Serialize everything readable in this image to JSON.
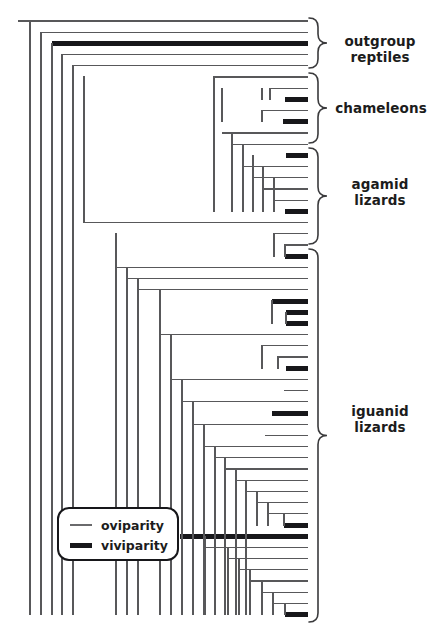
{
  "figure": {
    "type": "phylogenetic-cladogram",
    "width": 433,
    "height": 629,
    "background": "#ffffff",
    "line_color": "#58585a",
    "viviparity_color": "#17171a",
    "text_color": "#1c1c1c"
  },
  "legend": {
    "title": "",
    "box": {
      "x": 58,
      "y": 508,
      "width": 120,
      "height": 52,
      "radius": 11,
      "stroke": "#17171a",
      "stroke_width": 2
    },
    "items": [
      {
        "label": "oviparity",
        "style": "thin-line",
        "line_width": 1.3,
        "color": "#6a6a6c"
      },
      {
        "label": "viviparity",
        "style": "thick-line",
        "line_width": 5.0,
        "color": "#17171a"
      }
    ]
  },
  "clade_labels": [
    {
      "name": "outgroup-reptiles",
      "text": "outgroup\nreptiles",
      "x": 344,
      "y": 33,
      "bracket": {
        "top": 18,
        "bottom": 68
      }
    },
    {
      "name": "chameleons",
      "text": "chameleons",
      "x": 338,
      "y": 100,
      "bracket": {
        "top": 73,
        "bottom": 143
      }
    },
    {
      "name": "agamid-lizards",
      "text": "agamid\nlizards",
      "x": 350,
      "y": 176,
      "bracket": {
        "top": 148,
        "bottom": 244
      }
    },
    {
      "name": "iguanid-lizards",
      "text": "iguanid\nlizards",
      "x": 350,
      "y": 403,
      "bracket": {
        "top": 249,
        "bottom": 622
      }
    }
  ],
  "bracket": {
    "x": 318,
    "depth": 9,
    "stroke": "#3a3a3c",
    "stroke_width": 1.6
  },
  "chart_data": {
    "type": "cladogram",
    "title": "",
    "xlabel": "",
    "ylabel": "",
    "tip_count": 54,
    "tip_x": 308,
    "first_tip_y": 21,
    "tip_spacing": 11.2,
    "states": [
      "oviparity",
      "viviparity"
    ],
    "tips": [
      {
        "i": 0,
        "state": "oviparity",
        "node_x": 30
      },
      {
        "i": 1,
        "state": "oviparity",
        "node_x": 41
      },
      {
        "i": 2,
        "state": "viviparity",
        "node_x": 52,
        "vivi_from": 292
      },
      {
        "i": 3,
        "state": "oviparity",
        "node_x": 62
      },
      {
        "i": 4,
        "state": "oviparity",
        "node_x": 73
      },
      {
        "i": 5,
        "state": "oviparity",
        "node_x": 214
      },
      {
        "i": 6,
        "state": "oviparity",
        "node_x": 270
      },
      {
        "i": 7,
        "state": "viviparity",
        "node_x": 285,
        "vivi_from": 292
      },
      {
        "i": 8,
        "state": "oviparity",
        "node_x": 262
      },
      {
        "i": 9,
        "state": "viviparity",
        "node_x": 283,
        "vivi_from": 292
      },
      {
        "i": 10,
        "state": "oviparity",
        "node_x": 222
      },
      {
        "i": 11,
        "state": "oviparity",
        "node_x": 232
      },
      {
        "i": 12,
        "state": "viviparity",
        "node_x": 286,
        "vivi_from": 290
      },
      {
        "i": 13,
        "state": "oviparity",
        "node_x": 243
      },
      {
        "i": 14,
        "state": "oviparity",
        "node_x": 253
      },
      {
        "i": 15,
        "state": "oviparity",
        "node_x": 263
      },
      {
        "i": 16,
        "state": "oviparity",
        "node_x": 274
      },
      {
        "i": 17,
        "state": "viviparity",
        "node_x": 285,
        "vivi_from": 290
      },
      {
        "i": 18,
        "state": "oviparity",
        "node_x": 84
      },
      {
        "i": 19,
        "state": "oviparity",
        "node_x": 274
      },
      {
        "i": 20,
        "state": "oviparity",
        "node_x": 285
      },
      {
        "i": 21,
        "state": "viviparity",
        "node_x": 285,
        "vivi_from": 290
      },
      {
        "i": 22,
        "state": "oviparity",
        "node_x": 116
      },
      {
        "i": 23,
        "state": "oviparity",
        "node_x": 127
      },
      {
        "i": 24,
        "state": "oviparity",
        "node_x": 138
      },
      {
        "i": 25,
        "state": "viviparity",
        "node_x": 272,
        "vivi_from": 280
      },
      {
        "i": 26,
        "state": "viviparity",
        "node_x": 286,
        "vivi_from": 290
      },
      {
        "i": 27,
        "state": "viviparity",
        "node_x": 286,
        "vivi_from": 290
      },
      {
        "i": 28,
        "state": "oviparity",
        "node_x": 160
      },
      {
        "i": 29,
        "state": "oviparity",
        "node_x": 262
      },
      {
        "i": 30,
        "state": "oviparity",
        "node_x": 278
      },
      {
        "i": 31,
        "state": "viviparity",
        "node_x": 286,
        "vivi_from": 290
      },
      {
        "i": 32,
        "state": "oviparity",
        "node_x": 171
      },
      {
        "i": 33,
        "state": "oviparity",
        "node_x": 284
      },
      {
        "i": 34,
        "state": "oviparity",
        "node_x": 182
      },
      {
        "i": 35,
        "state": "viviparity",
        "node_x": 272,
        "vivi_from": 278
      },
      {
        "i": 36,
        "state": "oviparity",
        "node_x": 193
      },
      {
        "i": 37,
        "state": "oviparity",
        "node_x": 265
      },
      {
        "i": 38,
        "state": "oviparity",
        "node_x": 204
      },
      {
        "i": 39,
        "state": "oviparity",
        "node_x": 215
      },
      {
        "i": 40,
        "state": "oviparity",
        "node_x": 225
      },
      {
        "i": 41,
        "state": "oviparity",
        "node_x": 236
      },
      {
        "i": 42,
        "state": "oviparity",
        "node_x": 246
      },
      {
        "i": 43,
        "state": "oviparity",
        "node_x": 257
      },
      {
        "i": 44,
        "state": "oviparity",
        "node_x": 268
      },
      {
        "i": 45,
        "state": "viviparity",
        "node_x": 284,
        "vivi_from": 289
      },
      {
        "i": 46,
        "state": "viviparity",
        "node_x": 180,
        "vivi_from": 180
      },
      {
        "i": 47,
        "state": "oviparity",
        "node_x": 205
      },
      {
        "i": 48,
        "state": "oviparity",
        "node_x": 228
      },
      {
        "i": 49,
        "state": "oviparity",
        "node_x": 239
      },
      {
        "i": 50,
        "state": "oviparity",
        "node_x": 250
      },
      {
        "i": 51,
        "state": "oviparity",
        "node_x": 262
      },
      {
        "i": 52,
        "state": "oviparity",
        "node_x": 273
      },
      {
        "i": 53,
        "state": "viviparity",
        "node_x": 285,
        "vivi_from": 289
      }
    ],
    "internal_nodes": [
      {
        "id": "root",
        "x": 30,
        "top_i": 0,
        "bot_i": 53,
        "parent_x": 18
      },
      {
        "id": "n1",
        "x": 41,
        "top_i": 1,
        "bot_i": 53
      },
      {
        "id": "n2",
        "x": 52,
        "top_i": 2,
        "bot_i": 53
      },
      {
        "id": "n3",
        "x": 62,
        "top_i": 3,
        "bot_i": 53
      },
      {
        "id": "n4",
        "x": 73,
        "top_i": 4,
        "bot_i": 53
      },
      {
        "id": "n5",
        "x": 84,
        "top_i": 5,
        "bot_i": 18
      },
      {
        "id": "n6",
        "x": 214,
        "top_i": 5,
        "bot_i": 17
      },
      {
        "id": "n7",
        "x": 222,
        "top_i": 6,
        "bot_i": 9
      },
      {
        "id": "n8",
        "x": 262,
        "top_i": 6,
        "bot_i": 7
      },
      {
        "id": "n9",
        "x": 270,
        "top_i": 6,
        "bot_i": 7
      },
      {
        "id": "n10",
        "x": 262,
        "top_i": 8,
        "bot_i": 9
      },
      {
        "id": "n11",
        "x": 232,
        "top_i": 10,
        "bot_i": 17
      },
      {
        "id": "n12",
        "x": 243,
        "top_i": 11,
        "bot_i": 17
      },
      {
        "id": "n13",
        "x": 253,
        "top_i": 12,
        "bot_i": 17
      },
      {
        "id": "n14",
        "x": 263,
        "top_i": 13,
        "bot_i": 17
      },
      {
        "id": "n15",
        "x": 274,
        "top_i": 14,
        "bot_i": 17
      },
      {
        "id": "n16",
        "x": 116,
        "top_i": 19,
        "bot_i": 53
      },
      {
        "id": "n17",
        "x": 274,
        "top_i": 19,
        "bot_i": 21
      },
      {
        "id": "n18",
        "x": 285,
        "top_i": 20,
        "bot_i": 21
      },
      {
        "id": "n19",
        "x": 127,
        "top_i": 22,
        "bot_i": 53
      },
      {
        "id": "n20",
        "x": 138,
        "top_i": 23,
        "bot_i": 53
      },
      {
        "id": "n21",
        "x": 160,
        "top_i": 24,
        "bot_i": 53
      },
      {
        "id": "n22",
        "x": 272,
        "top_i": 25,
        "bot_i": 27
      },
      {
        "id": "n23",
        "x": 286,
        "top_i": 26,
        "bot_i": 27
      },
      {
        "id": "n24",
        "x": 171,
        "top_i": 28,
        "bot_i": 53
      },
      {
        "id": "n25",
        "x": 262,
        "top_i": 29,
        "bot_i": 31
      },
      {
        "id": "n26",
        "x": 278,
        "top_i": 30,
        "bot_i": 31
      },
      {
        "id": "n27",
        "x": 182,
        "top_i": 32,
        "bot_i": 53
      },
      {
        "id": "n28",
        "x": 193,
        "top_i": 34,
        "bot_i": 53
      },
      {
        "id": "n29",
        "x": 204,
        "top_i": 36,
        "bot_i": 53
      },
      {
        "id": "n30",
        "x": 215,
        "top_i": 38,
        "bot_i": 53
      },
      {
        "id": "n31",
        "x": 225,
        "top_i": 39,
        "bot_i": 53
      },
      {
        "id": "n32",
        "x": 236,
        "top_i": 40,
        "bot_i": 53
      },
      {
        "id": "n33",
        "x": 246,
        "top_i": 41,
        "bot_i": 53
      },
      {
        "id": "n34",
        "x": 257,
        "top_i": 42,
        "bot_i": 45
      },
      {
        "id": "n35",
        "x": 268,
        "top_i": 43,
        "bot_i": 45
      },
      {
        "id": "n36",
        "x": 284,
        "top_i": 44,
        "bot_i": 45
      },
      {
        "id": "n37",
        "x": 205,
        "top_i": 46,
        "bot_i": 53
      },
      {
        "id": "n38",
        "x": 228,
        "top_i": 47,
        "bot_i": 53
      },
      {
        "id": "n39",
        "x": 239,
        "top_i": 48,
        "bot_i": 53
      },
      {
        "id": "n40",
        "x": 250,
        "top_i": 49,
        "bot_i": 53
      },
      {
        "id": "n41",
        "x": 262,
        "top_i": 50,
        "bot_i": 53
      },
      {
        "id": "n42",
        "x": 273,
        "top_i": 51,
        "bot_i": 53
      },
      {
        "id": "n43",
        "x": 285,
        "top_i": 52,
        "bot_i": 53
      }
    ]
  }
}
